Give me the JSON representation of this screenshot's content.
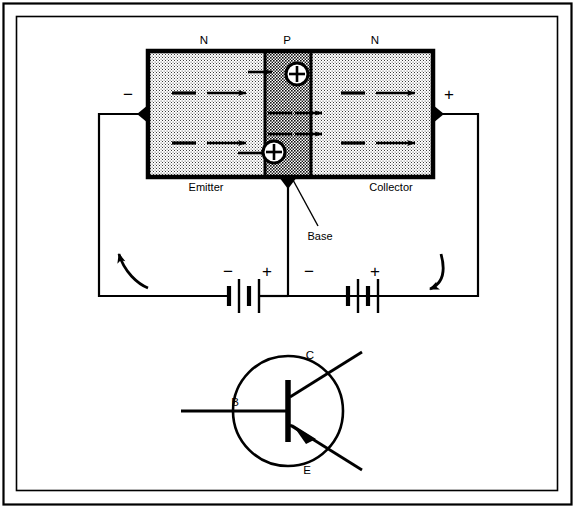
{
  "figure": {
    "frame_color": "#000000",
    "background_color": "#ffffff",
    "ink_color": "#000000"
  },
  "semiconductor_block": {
    "regions": [
      {
        "id": "emitter",
        "doping_label": "N",
        "terminal_label": "Emitter",
        "fill": "light-stipple"
      },
      {
        "id": "base",
        "doping_label": "P",
        "terminal_label": "Base",
        "fill": "dark-stipple"
      },
      {
        "id": "collector",
        "doping_label": "N",
        "terminal_label": "Collector",
        "fill": "light-stipple"
      }
    ],
    "carriers": [
      {
        "type": "hole",
        "glyph": "+",
        "circled": true,
        "location": "base-upper"
      },
      {
        "type": "hole",
        "glyph": "+",
        "circled": true,
        "location": "base-lower"
      }
    ],
    "electron_marks": [
      {
        "glyph": "−",
        "region": "emitter",
        "row": "upper"
      },
      {
        "glyph": "−",
        "region": "emitter",
        "row": "lower"
      },
      {
        "glyph": "−",
        "region": "collector",
        "row": "upper"
      },
      {
        "glyph": "−",
        "region": "collector",
        "row": "lower"
      },
      {
        "glyph": "−",
        "region": "base",
        "row": "mid-upper"
      },
      {
        "glyph": "−",
        "region": "base",
        "row": "mid-lower"
      }
    ],
    "terminal_polarity": {
      "emitter_sign": "−",
      "collector_sign": "+"
    }
  },
  "bias_circuit": {
    "batteries": [
      {
        "id": "emitter-base-battery",
        "left_sign": "−",
        "right_sign": "+",
        "cells": 2
      },
      {
        "id": "base-collector-battery",
        "left_sign": "−",
        "right_sign": "+",
        "cells": 2
      }
    ],
    "current_arrows": [
      {
        "id": "left-current-arrow",
        "direction": "up-left"
      },
      {
        "id": "right-current-arrow",
        "direction": "down-left"
      }
    ]
  },
  "schematic_symbol": {
    "device": "NPN transistor",
    "terminals": [
      {
        "id": "base",
        "label": "B"
      },
      {
        "id": "collector",
        "label": "C"
      },
      {
        "id": "emitter",
        "label": "E"
      }
    ]
  }
}
